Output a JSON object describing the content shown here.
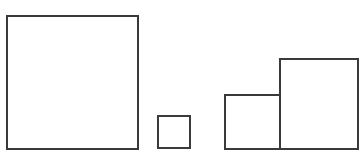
{
  "diagram": {
    "stroke_color": "#3a3a3a",
    "background": "#ffffff",
    "shapes": [
      {
        "id": "large-square",
        "x": 6,
        "y": 15,
        "w": 133,
        "h": 135
      },
      {
        "id": "small-square",
        "x": 157,
        "y": 115,
        "w": 34,
        "h": 34
      },
      {
        "id": "medium-square",
        "x": 224,
        "y": 94,
        "w": 57,
        "h": 56
      },
      {
        "id": "right-square",
        "x": 279,
        "y": 58,
        "w": 80,
        "h": 92
      }
    ]
  }
}
